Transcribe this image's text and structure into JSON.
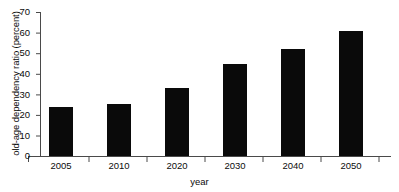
{
  "chart_data": {
    "type": "bar",
    "title": "",
    "subtitle": "",
    "xlabel": "year",
    "ylabel": "old-age dependency ratio (percent)",
    "categories": [
      "2005",
      "2010",
      "2020",
      "2030",
      "2040",
      "2050"
    ],
    "values": [
      24,
      25.5,
      33,
      44.5,
      52,
      61
    ],
    "ylim": [
      0,
      70
    ],
    "yticks": [
      0,
      10,
      20,
      30,
      40,
      50,
      60,
      70
    ],
    "ytick_labels": [
      "0",
      "10",
      "20",
      "30",
      "40",
      "50",
      "60",
      "70"
    ],
    "grid": false,
    "legend": null,
    "bar_color": "#0a0a0a",
    "axis_color": "#4a4a4a",
    "background": "#ffffff"
  }
}
